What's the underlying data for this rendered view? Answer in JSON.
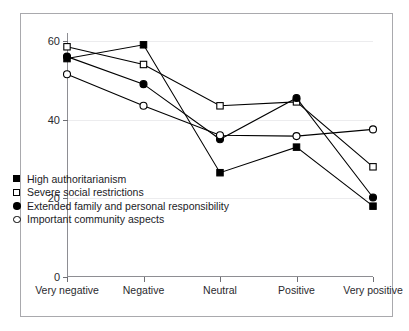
{
  "chart_data": {
    "type": "line",
    "title": "",
    "xlabel": "",
    "ylabel": "",
    "categories": [
      "Very negative",
      "Negative",
      "Neutral",
      "Positive",
      "Very positive"
    ],
    "ylim": [
      0,
      62
    ],
    "yticks": [
      0,
      20,
      40,
      60
    ],
    "ytick_labels": [
      "0",
      "20",
      "40",
      "60"
    ],
    "grid": true,
    "legend_position": "lower-left-inside",
    "series": [
      {
        "name": "High authoritarianism",
        "marker": "filled-square",
        "values": [
          55.5,
          59.0,
          26.5,
          33.0,
          18.0
        ]
      },
      {
        "name": "Severe social restrictions",
        "marker": "open-square",
        "values": [
          58.5,
          54.0,
          43.5,
          44.5,
          28.0
        ]
      },
      {
        "name": "Extended family and personal responsibility",
        "marker": "filled-circle",
        "values": [
          56.0,
          49.0,
          35.0,
          45.5,
          20.2
        ]
      },
      {
        "name": "Important community aspects",
        "marker": "open-circle",
        "values": [
          51.5,
          43.5,
          36.0,
          35.8,
          37.5
        ]
      }
    ]
  },
  "legend": {
    "items": [
      {
        "label": "High authoritarianism",
        "marker": "filled-square"
      },
      {
        "label": "Severe social restrictions",
        "marker": "open-square"
      },
      {
        "label": "Extended family and personal responsibility",
        "marker": "filled-circle"
      },
      {
        "label": "Important community aspects",
        "marker": "open-circle"
      }
    ]
  },
  "colors": {
    "line": "#000000",
    "axis": "#8e8e93",
    "grid": "#ececee",
    "frame": "#a9a9ad",
    "text": "#1b1b1f",
    "background": "#ffffff"
  }
}
